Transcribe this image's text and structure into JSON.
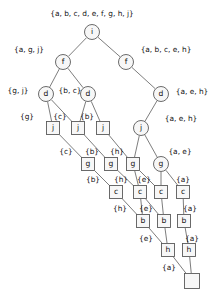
{
  "figure": {
    "kind": "binary-decision-diagram",
    "root_set_label": "{a, b, c, d, e, f, g, h, j}",
    "colors": {
      "background": "#ffffff",
      "edge": "#6e6e6e",
      "node_stroke": "#5a5a5a",
      "node_fill": "#f7f7f7",
      "text": "#111111"
    }
  },
  "nodes": [
    {
      "id": "n_i",
      "label": "i",
      "shape": "circle",
      "x": 92,
      "y": 32,
      "r": 7.5
    },
    {
      "id": "n_f1",
      "label": "f",
      "shape": "circle",
      "x": 63,
      "y": 62,
      "r": 7.5
    },
    {
      "id": "n_f2",
      "label": "f",
      "shape": "circle",
      "x": 126,
      "y": 62,
      "r": 7.5
    },
    {
      "id": "n_d1",
      "label": "d",
      "shape": "circle",
      "x": 46,
      "y": 94,
      "r": 7.5
    },
    {
      "id": "n_d2",
      "label": "d",
      "shape": "circle",
      "x": 88,
      "y": 94,
      "r": 7.5
    },
    {
      "id": "n_d3",
      "label": "d",
      "shape": "circle",
      "x": 161,
      "y": 94,
      "r": 7.5
    },
    {
      "id": "n_j1",
      "label": "j",
      "shape": "square",
      "x": 53,
      "y": 128,
      "s": 13
    },
    {
      "id": "n_j2",
      "label": "j",
      "shape": "square",
      "x": 78,
      "y": 128,
      "s": 13
    },
    {
      "id": "n_j3",
      "label": "j",
      "shape": "square",
      "x": 103,
      "y": 128,
      "s": 13
    },
    {
      "id": "n_j4",
      "label": "j",
      "shape": "circle",
      "x": 141,
      "y": 128,
      "r": 7.5
    },
    {
      "id": "n_g1",
      "label": "g",
      "shape": "square",
      "x": 88,
      "y": 164,
      "s": 13
    },
    {
      "id": "n_g2",
      "label": "g",
      "shape": "square",
      "x": 111,
      "y": 164,
      "s": 13
    },
    {
      "id": "n_g3",
      "label": "g",
      "shape": "square",
      "x": 133,
      "y": 164,
      "s": 13
    },
    {
      "id": "n_g4",
      "label": "g",
      "shape": "circle",
      "x": 161,
      "y": 164,
      "r": 7.5
    },
    {
      "id": "n_c1",
      "label": "c",
      "shape": "square",
      "x": 116,
      "y": 192,
      "s": 13
    },
    {
      "id": "n_c2",
      "label": "c",
      "shape": "square",
      "x": 140,
      "y": 192,
      "s": 13
    },
    {
      "id": "n_c3",
      "label": "c",
      "shape": "square",
      "x": 161,
      "y": 192,
      "s": 13
    },
    {
      "id": "n_c4",
      "label": "c",
      "shape": "square",
      "x": 183,
      "y": 192,
      "s": 13
    },
    {
      "id": "n_b1",
      "label": "b",
      "shape": "square",
      "x": 143,
      "y": 221,
      "s": 13
    },
    {
      "id": "n_b2",
      "label": "b",
      "shape": "square",
      "x": 164,
      "y": 221,
      "s": 13
    },
    {
      "id": "n_b3",
      "label": "b",
      "shape": "square",
      "x": 184,
      "y": 221,
      "s": 13
    },
    {
      "id": "n_h1",
      "label": "h",
      "shape": "square",
      "x": 168,
      "y": 250,
      "s": 13
    },
    {
      "id": "n_h2",
      "label": "h",
      "shape": "square",
      "x": 189,
      "y": 250,
      "s": 13
    },
    {
      "id": "n_end",
      "label": "",
      "shape": "square",
      "x": 192,
      "y": 281,
      "s": 15
    }
  ],
  "edges": [
    {
      "from": "n_i",
      "to": "n_f1"
    },
    {
      "from": "n_i",
      "to": "n_f2"
    },
    {
      "from": "n_f1",
      "to": "n_d1"
    },
    {
      "from": "n_f1",
      "to": "n_d2"
    },
    {
      "from": "n_f2",
      "to": "n_d3"
    },
    {
      "from": "n_d1",
      "to": "n_j1"
    },
    {
      "from": "n_d1",
      "to": "n_j2"
    },
    {
      "from": "n_d2",
      "to": "n_j2"
    },
    {
      "from": "n_d2",
      "to": "n_j3"
    },
    {
      "from": "n_d3",
      "to": "n_j4"
    },
    {
      "from": "n_j1",
      "to": "n_g1"
    },
    {
      "from": "n_j2",
      "to": "n_g2"
    },
    {
      "from": "n_j3",
      "to": "n_g3"
    },
    {
      "from": "n_j4",
      "to": "n_g3"
    },
    {
      "from": "n_j4",
      "to": "n_g4"
    },
    {
      "from": "n_g1",
      "to": "n_c1"
    },
    {
      "from": "n_g2",
      "to": "n_c2"
    },
    {
      "from": "n_g3",
      "to": "n_c2"
    },
    {
      "from": "n_g3",
      "to": "n_c3"
    },
    {
      "from": "n_g4",
      "to": "n_c3"
    },
    {
      "from": "n_g4",
      "to": "n_c4"
    },
    {
      "from": "n_c1",
      "to": "n_b1"
    },
    {
      "from": "n_c2",
      "to": "n_b1"
    },
    {
      "from": "n_c2",
      "to": "n_b2"
    },
    {
      "from": "n_c3",
      "to": "n_b2"
    },
    {
      "from": "n_c4",
      "to": "n_b3"
    },
    {
      "from": "n_b1",
      "to": "n_h1"
    },
    {
      "from": "n_b2",
      "to": "n_h1"
    },
    {
      "from": "n_b3",
      "to": "n_h2"
    },
    {
      "from": "n_h1",
      "to": "n_end"
    },
    {
      "from": "n_h2",
      "to": "n_end"
    }
  ],
  "set_labels": [
    {
      "id": "lbl_root",
      "text": "{a, b, c, d, e, f, g, h, j}",
      "x": 92,
      "y": 14,
      "anchor": "middle"
    },
    {
      "id": "lbl_agj",
      "text": "{a, g, j}",
      "x": 29,
      "y": 50,
      "anchor": "middle"
    },
    {
      "id": "lbl_abceh",
      "text": "{a, b, c, e, h}",
      "x": 166,
      "y": 50,
      "anchor": "middle"
    },
    {
      "id": "lbl_gj",
      "text": "{g, j}",
      "x": 18,
      "y": 91,
      "anchor": "middle"
    },
    {
      "id": "lbl_bc",
      "text": "{b, c}",
      "x": 70,
      "y": 91,
      "anchor": "middle"
    },
    {
      "id": "lbl_aeh1",
      "text": "{a, e, h}",
      "x": 192,
      "y": 92,
      "anchor": "middle"
    },
    {
      "id": "lbl_g",
      "text": "{g}",
      "x": 27,
      "y": 117,
      "anchor": "middle"
    },
    {
      "id": "lbl_c1",
      "text": "{c}",
      "x": 60,
      "y": 117,
      "anchor": "middle"
    },
    {
      "id": "lbl_b1",
      "text": "{b}",
      "x": 87,
      "y": 117,
      "anchor": "middle"
    },
    {
      "id": "lbl_aeh2",
      "text": "{a, e, h}",
      "x": 181,
      "y": 119,
      "anchor": "middle"
    },
    {
      "id": "lbl_c2",
      "text": "{c}",
      "x": 66,
      "y": 152,
      "anchor": "middle"
    },
    {
      "id": "lbl_b2",
      "text": "{b}",
      "x": 92,
      "y": 152,
      "anchor": "middle"
    },
    {
      "id": "lbl_h1",
      "text": "{h}",
      "x": 117,
      "y": 152,
      "anchor": "middle"
    },
    {
      "id": "lbl_ae",
      "text": "{a, e}",
      "x": 180,
      "y": 152,
      "anchor": "middle"
    },
    {
      "id": "lbl_b3",
      "text": "{b}",
      "x": 93,
      "y": 180,
      "anchor": "middle"
    },
    {
      "id": "lbl_h2",
      "text": "{h}",
      "x": 121,
      "y": 180,
      "anchor": "middle"
    },
    {
      "id": "lbl_e1",
      "text": "{e}",
      "x": 144,
      "y": 180,
      "anchor": "middle"
    },
    {
      "id": "lbl_a1",
      "text": "{a}",
      "x": 183,
      "y": 180,
      "anchor": "middle"
    },
    {
      "id": "lbl_h3",
      "text": "{h}",
      "x": 120,
      "y": 209,
      "anchor": "middle"
    },
    {
      "id": "lbl_e2",
      "text": "{e}",
      "x": 146,
      "y": 209,
      "anchor": "middle"
    },
    {
      "id": "lbl_a2",
      "text": "{a}",
      "x": 190,
      "y": 209,
      "anchor": "middle"
    },
    {
      "id": "lbl_e3",
      "text": "{e}",
      "x": 146,
      "y": 239,
      "anchor": "middle"
    },
    {
      "id": "lbl_a3",
      "text": "{a}",
      "x": 192,
      "y": 239,
      "anchor": "middle"
    },
    {
      "id": "lbl_a4",
      "text": "{a}",
      "x": 169,
      "y": 268,
      "anchor": "middle"
    }
  ]
}
